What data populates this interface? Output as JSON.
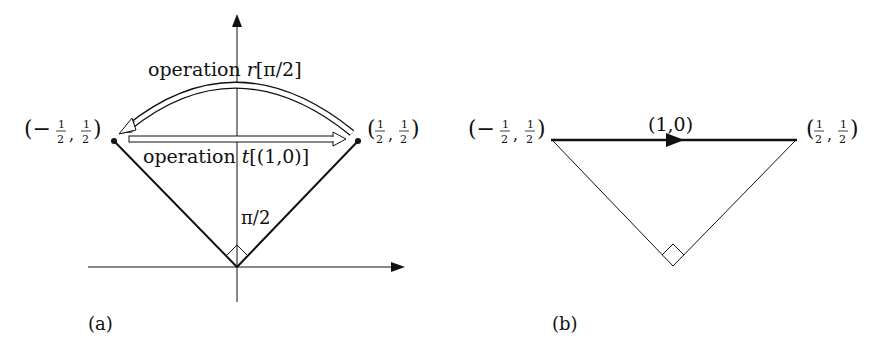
{
  "figure": {
    "panel_a": {
      "caption": "(a)",
      "rotation_label_prefix": "operation ",
      "rotation_label_op": "r",
      "rotation_label_arg": "[π/2]",
      "translation_label_prefix": "operation ",
      "translation_label_op": "t",
      "translation_label_arg": "[(1,0)]",
      "angle_label": "π/2",
      "left_point": {
        "open": "(−",
        "num": "1",
        "den": "2",
        "sep": ",",
        "num2": "1",
        "den2": "2",
        "close": ")"
      },
      "right_point": {
        "open": "(",
        "num": "1",
        "den": "2",
        "sep": ",",
        "num2": "1",
        "den2": "2",
        "close": ")"
      }
    },
    "panel_b": {
      "caption": "(b)",
      "vector_label": "(1,0)",
      "left_point": {
        "open": "(−",
        "num": "1",
        "den": "2",
        "sep": ",",
        "num2": "1",
        "den2": "2",
        "close": ")"
      },
      "right_point": {
        "open": "(",
        "num": "1",
        "den": "2",
        "sep": ",",
        "num2": "1",
        "den2": "2",
        "close": ")"
      }
    },
    "colors": {
      "ink": "#111111",
      "background": "#ffffff"
    }
  }
}
